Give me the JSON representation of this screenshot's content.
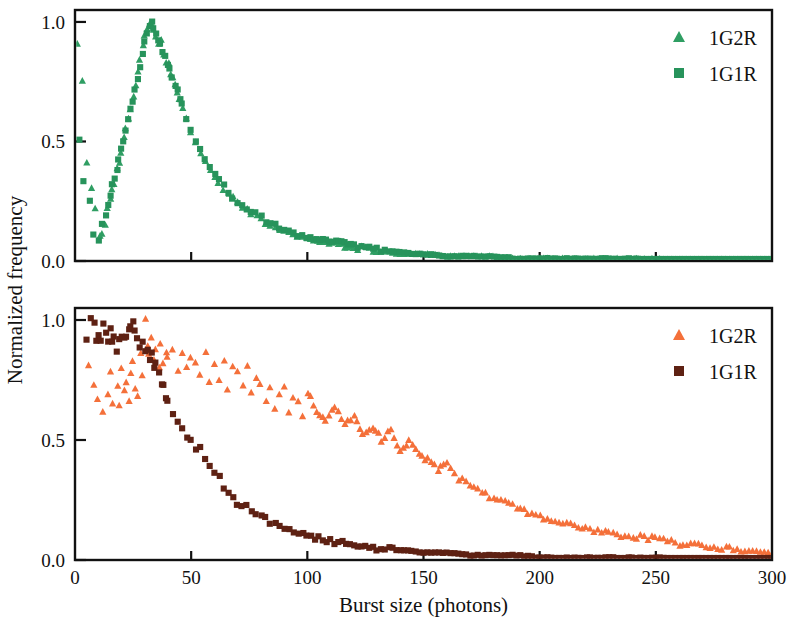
{
  "figure": {
    "xlabel": "Burst size (photons)",
    "ylabel": "Normalized frequency"
  },
  "colors": {
    "green_triangle": "#2f9e63",
    "green_square": "#27935b",
    "orange_triangle": "#f4703a",
    "brown_square": "#5e2113",
    "axis": "#111111",
    "background": "#ffffff"
  },
  "panels": {
    "top": {
      "legend": [
        {
          "label": "1G2R",
          "marker": "triangle",
          "color": "#2f9e63"
        },
        {
          "label": "1G1R",
          "marker": "square",
          "color": "#27935b"
        }
      ],
      "xticks": [
        "0",
        "50",
        "100",
        "150",
        "200",
        "250",
        "300"
      ],
      "yticks": [
        "0.0",
        "0.5",
        "1.0"
      ]
    },
    "bottom": {
      "legend": [
        {
          "label": "1G2R",
          "marker": "triangle",
          "color": "#f4703a"
        },
        {
          "label": "1G1R",
          "marker": "square",
          "color": "#5e2113"
        }
      ],
      "xticks": [
        "0",
        "50",
        "100",
        "150",
        "200",
        "250",
        "300"
      ],
      "yticks": [
        "0.0",
        "0.5",
        "1.0"
      ]
    }
  },
  "chart_data": {
    "type": "scatter",
    "title": "",
    "xlabel": "Burst size (photons)",
    "ylabel": "Normalized frequency",
    "xlim": [
      0,
      300
    ],
    "ylim": [
      0.0,
      1.05
    ],
    "xticks": [
      0,
      50,
      100,
      150,
      200,
      250,
      300
    ],
    "yticks": [
      0.0,
      0.5,
      1.0
    ],
    "grid": false,
    "panels": [
      {
        "name": "top",
        "legend_position": "top-right",
        "series": [
          {
            "name": "1G2R",
            "marker": "triangle",
            "color": "#2f9e63",
            "x": [
              1,
              3,
              5,
              7,
              9,
              11,
              12,
              13,
              14,
              15,
              16,
              17,
              18,
              19,
              20,
              21,
              22,
              23,
              24,
              25,
              26,
              27,
              28,
              29,
              30,
              31,
              32,
              33,
              34,
              35,
              36,
              37,
              38,
              39,
              40,
              41,
              42,
              43,
              44,
              45,
              46,
              48,
              50,
              52,
              54,
              56,
              58,
              60,
              62,
              64,
              66,
              68,
              70,
              72,
              74,
              76,
              78,
              80,
              82,
              84,
              86,
              88,
              90,
              92,
              94,
              96,
              98,
              100,
              104,
              108,
              112,
              116,
              120,
              125,
              130,
              135,
              140,
              145,
              150,
              160,
              170,
              180,
              190,
              200,
              210,
              220,
              230,
              240,
              250,
              260,
              270,
              280,
              290,
              300
            ],
            "y": [
              0.9,
              0.76,
              0.42,
              0.3,
              0.23,
              0.1,
              0.12,
              0.16,
              0.22,
              0.27,
              0.31,
              0.33,
              0.38,
              0.41,
              0.46,
              0.52,
              0.56,
              0.6,
              0.64,
              0.68,
              0.74,
              0.8,
              0.85,
              0.9,
              0.94,
              0.97,
              1.0,
              0.99,
              0.96,
              0.94,
              0.91,
              0.92,
              0.87,
              0.84,
              0.82,
              0.79,
              0.76,
              0.73,
              0.7,
              0.67,
              0.64,
              0.59,
              0.54,
              0.5,
              0.46,
              0.42,
              0.39,
              0.36,
              0.33,
              0.3,
              0.28,
              0.26,
              0.24,
              0.23,
              0.21,
              0.2,
              0.19,
              0.17,
              0.16,
              0.15,
              0.14,
              0.13,
              0.13,
              0.12,
              0.11,
              0.11,
              0.1,
              0.1,
              0.09,
              0.08,
              0.07,
              0.06,
              0.06,
              0.05,
              0.04,
              0.04,
              0.03,
              0.03,
              0.03,
              0.02,
              0.02,
              0.02,
              0.01,
              0.01,
              0.01,
              0.01,
              0.01,
              0.01,
              0.01,
              0.0,
              0.0,
              0.0,
              0.0,
              0.0
            ]
          },
          {
            "name": "1G1R",
            "marker": "square",
            "color": "#27935b",
            "x": [
              2,
              4,
              6,
              8,
              10,
              12,
              13,
              14,
              15,
              16,
              17,
              18,
              19,
              20,
              21,
              22,
              23,
              24,
              25,
              26,
              27,
              28,
              29,
              30,
              31,
              32,
              33,
              34,
              35,
              36,
              37,
              38,
              39,
              40,
              41,
              42,
              43,
              44,
              45,
              46,
              48,
              50,
              52,
              54,
              56,
              58,
              60,
              62,
              64,
              66,
              68,
              70,
              72,
              74,
              76,
              78,
              80,
              82,
              84,
              86,
              88,
              90,
              92,
              94,
              96,
              98,
              100,
              104,
              108,
              112,
              116,
              120,
              125,
              130,
              135,
              140,
              145,
              150,
              160,
              170,
              180,
              190,
              200,
              210,
              220,
              230,
              240,
              250,
              260,
              270,
              280,
              290,
              300
            ],
            "y": [
              0.5,
              0.34,
              0.26,
              0.11,
              0.08,
              0.15,
              0.19,
              0.24,
              0.28,
              0.32,
              0.35,
              0.39,
              0.43,
              0.47,
              0.51,
              0.55,
              0.59,
              0.63,
              0.67,
              0.72,
              0.77,
              0.82,
              0.87,
              0.92,
              0.96,
              0.99,
              1.0,
              0.98,
              0.95,
              0.93,
              0.9,
              0.88,
              0.85,
              0.83,
              0.8,
              0.77,
              0.74,
              0.71,
              0.68,
              0.65,
              0.6,
              0.55,
              0.51,
              0.47,
              0.43,
              0.4,
              0.37,
              0.34,
              0.31,
              0.29,
              0.27,
              0.25,
              0.24,
              0.22,
              0.21,
              0.2,
              0.18,
              0.17,
              0.16,
              0.15,
              0.14,
              0.14,
              0.13,
              0.12,
              0.11,
              0.11,
              0.1,
              0.09,
              0.08,
              0.08,
              0.07,
              0.06,
              0.05,
              0.05,
              0.04,
              0.04,
              0.03,
              0.03,
              0.02,
              0.02,
              0.02,
              0.01,
              0.01,
              0.01,
              0.01,
              0.01,
              0.01,
              0.0,
              0.0,
              0.0,
              0.0,
              0.0,
              0.0
            ]
          }
        ]
      },
      {
        "name": "bottom",
        "legend_position": "top-right",
        "series": [
          {
            "name": "1G2R",
            "marker": "triangle",
            "color": "#f4703a",
            "x": [
              6,
              8,
              10,
              12,
              14,
              15,
              16,
              18,
              19,
              20,
              21,
              22,
              23,
              24,
              25,
              26,
              27,
              28,
              29,
              30,
              31,
              32,
              33,
              34,
              35,
              36,
              37,
              38,
              39,
              40,
              42,
              44,
              46,
              48,
              50,
              52,
              54,
              56,
              58,
              60,
              62,
              64,
              66,
              68,
              70,
              72,
              74,
              76,
              78,
              80,
              82,
              84,
              86,
              88,
              90,
              92,
              94,
              96,
              98,
              100,
              104,
              108,
              112,
              116,
              120,
              124,
              128,
              132,
              136,
              140,
              144,
              148,
              152,
              156,
              160,
              165,
              170,
              175,
              180,
              185,
              190,
              195,
              200,
              210,
              220,
              230,
              240,
              250,
              260,
              270,
              280,
              290,
              300
            ],
            "y": [
              0.82,
              0.74,
              0.68,
              0.61,
              0.7,
              0.78,
              0.66,
              0.72,
              0.64,
              0.8,
              0.7,
              0.74,
              0.66,
              0.77,
              0.82,
              0.72,
              0.68,
              0.86,
              0.76,
              1.0,
              0.9,
              0.86,
              0.92,
              0.84,
              0.88,
              0.8,
              0.9,
              0.82,
              0.86,
              0.84,
              0.88,
              0.78,
              0.86,
              0.8,
              0.84,
              0.82,
              0.78,
              0.86,
              0.74,
              0.82,
              0.76,
              0.84,
              0.72,
              0.8,
              0.78,
              0.72,
              0.82,
              0.7,
              0.76,
              0.74,
              0.66,
              0.72,
              0.64,
              0.7,
              0.72,
              0.62,
              0.68,
              0.66,
              0.6,
              0.7,
              0.62,
              0.58,
              0.64,
              0.56,
              0.6,
              0.52,
              0.56,
              0.5,
              0.54,
              0.46,
              0.5,
              0.44,
              0.42,
              0.38,
              0.4,
              0.34,
              0.32,
              0.28,
              0.26,
              0.24,
              0.22,
              0.2,
              0.18,
              0.16,
              0.13,
              0.11,
              0.1,
              0.09,
              0.07,
              0.06,
              0.05,
              0.04,
              0.03
            ]
          },
          {
            "name": "1G1R",
            "marker": "square",
            "color": "#5e2113",
            "x": [
              5,
              7,
              8,
              9,
              10,
              11,
              12,
              13,
              14,
              15,
              16,
              17,
              18,
              19,
              20,
              21,
              22,
              23,
              24,
              25,
              26,
              27,
              28,
              29,
              30,
              31,
              32,
              33,
              34,
              35,
              36,
              37,
              38,
              39,
              40,
              42,
              44,
              46,
              48,
              50,
              52,
              54,
              56,
              58,
              60,
              62,
              64,
              66,
              68,
              70,
              72,
              74,
              76,
              78,
              80,
              82,
              84,
              86,
              88,
              90,
              92,
              94,
              96,
              98,
              100,
              105,
              110,
              115,
              120,
              125,
              130,
              135,
              140,
              145,
              150,
              160,
              170,
              180,
              190,
              200,
              210,
              220,
              230,
              240,
              250,
              260,
              270,
              280,
              290,
              300
            ],
            "y": [
              0.92,
              1.0,
              0.98,
              0.92,
              0.94,
              0.92,
              0.98,
              0.94,
              0.92,
              0.96,
              0.92,
              0.94,
              0.86,
              0.92,
              0.94,
              0.92,
              0.94,
              0.96,
              0.98,
              1.0,
              0.96,
              0.92,
              0.88,
              0.9,
              0.86,
              0.88,
              0.84,
              0.86,
              0.8,
              0.82,
              0.78,
              0.74,
              0.72,
              0.68,
              0.66,
              0.6,
              0.58,
              0.54,
              0.52,
              0.5,
              0.46,
              0.48,
              0.42,
              0.4,
              0.36,
              0.34,
              0.3,
              0.28,
              0.26,
              0.24,
              0.23,
              0.22,
              0.2,
              0.19,
              0.18,
              0.17,
              0.16,
              0.15,
              0.14,
              0.13,
              0.13,
              0.12,
              0.11,
              0.11,
              0.1,
              0.09,
              0.08,
              0.07,
              0.06,
              0.06,
              0.05,
              0.05,
              0.04,
              0.04,
              0.03,
              0.03,
              0.02,
              0.02,
              0.02,
              0.01,
              0.01,
              0.01,
              0.01,
              0.01,
              0.01,
              0.0,
              0.0,
              0.0,
              0.0,
              0.0
            ]
          }
        ]
      }
    ]
  }
}
